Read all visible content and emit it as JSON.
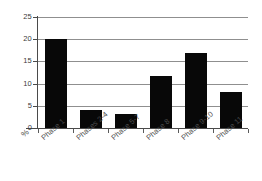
{
  "chart_data": {
    "type": "bar",
    "title": "",
    "subtitle": "",
    "xlabel": "",
    "ylabel": "%",
    "categories": [
      "Phase 1",
      "Phases 2-4",
      "Phase 5-7",
      "Phase 8",
      "Phase 9-10",
      "Phase 11"
    ],
    "values": [
      20.0,
      4.0,
      3.2,
      11.7,
      16.8,
      8.1
    ],
    "ylim": [
      0,
      25
    ],
    "ytick_labels": [
      "0",
      "5",
      "10",
      "15",
      "20",
      "25"
    ],
    "ytick_values": [
      0,
      5,
      10,
      15,
      20,
      25
    ],
    "grid": "horizontal",
    "legend": "none",
    "bar_color": "#080808",
    "gridline_color": "#8f8f8f",
    "axis_color": "#4a4a4a",
    "background_color": "#ffffff"
  },
  "axis": {
    "percent_symbol": "%"
  }
}
